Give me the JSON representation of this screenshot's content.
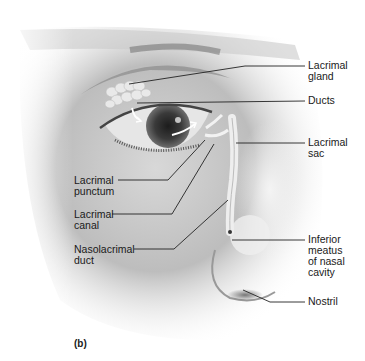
{
  "figure": {
    "panel": "(b)",
    "labels_right": [
      {
        "id": "lacrimal-gland",
        "text": "Lacrimal\ngland",
        "x": 308,
        "y": 62
      },
      {
        "id": "ducts",
        "text": "Ducts",
        "x": 308,
        "y": 96
      },
      {
        "id": "lacrimal-sac",
        "text": "Lacrimal\nsac",
        "x": 308,
        "y": 137
      },
      {
        "id": "inferior-meatus",
        "text": "Inferior\nmeatus\nof nasal\ncavity",
        "x": 308,
        "y": 236
      },
      {
        "id": "nostril",
        "text": "Nostril",
        "x": 308,
        "y": 294
      }
    ],
    "labels_left": [
      {
        "id": "lacrimal-punctum",
        "text": "Lacrimal\npunctum",
        "x": 74,
        "y": 175
      },
      {
        "id": "lacrimal-canal",
        "text": "Lacrimal\ncanal",
        "x": 74,
        "y": 209
      },
      {
        "id": "nasolacrimal-duct",
        "text": "Nasolacrimal\nduct",
        "x": 74,
        "y": 244
      }
    ]
  }
}
